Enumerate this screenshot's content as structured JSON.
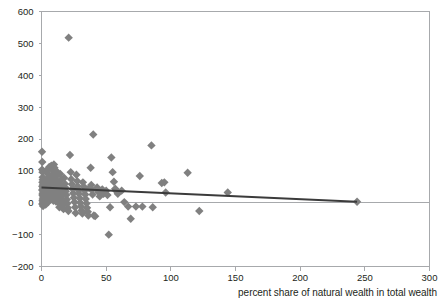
{
  "chart_data": {
    "type": "scatter",
    "title": "",
    "subtitle": "",
    "xlabel": "percent share of natural wealth in total wealth",
    "ylabel": "",
    "xlim": [
      0,
      300
    ],
    "ylim": [
      -200,
      600
    ],
    "xticks": [
      0,
      50,
      100,
      150,
      200,
      250,
      300
    ],
    "yticks": [
      -200,
      -100,
      0,
      100,
      200,
      300,
      400,
      500,
      600
    ],
    "xtick_labels": [
      "0",
      "50",
      "100",
      "150",
      "200",
      "250",
      "300"
    ],
    "ytick_labels": [
      "−200",
      "−100",
      "0",
      "100",
      "200",
      "300",
      "400",
      "500",
      "600"
    ],
    "grid": false,
    "legend": false,
    "legend_position": "none",
    "marker": {
      "shape": "diamond",
      "color": "#808080",
      "size": 4.2
    },
    "series": [
      {
        "name": "countries",
        "type": "scatter",
        "points": [
          [
            0.4,
            160
          ],
          [
            0.6,
            128
          ],
          [
            0.5,
            104
          ],
          [
            0.8,
            96
          ],
          [
            0.9,
            80
          ],
          [
            1.0,
            72
          ],
          [
            0.7,
            64
          ],
          [
            1.2,
            58
          ],
          [
            0.6,
            52
          ],
          [
            1.1,
            46
          ],
          [
            0.5,
            40
          ],
          [
            1.4,
            36
          ],
          [
            0.9,
            30
          ],
          [
            0.7,
            24
          ],
          [
            1.3,
            18
          ],
          [
            1.0,
            12
          ],
          [
            0.8,
            6
          ],
          [
            1.5,
            2
          ],
          [
            0.6,
            -4
          ],
          [
            1.2,
            -10
          ],
          [
            2.1,
            68
          ],
          [
            2.4,
            54
          ],
          [
            2.0,
            44
          ],
          [
            2.6,
            38
          ],
          [
            2.2,
            30
          ],
          [
            2.8,
            22
          ],
          [
            2.3,
            14
          ],
          [
            3.0,
            8
          ],
          [
            2.5,
            2
          ],
          [
            3.2,
            -6
          ],
          [
            3.6,
            96
          ],
          [
            4.0,
            74
          ],
          [
            3.8,
            58
          ],
          [
            4.4,
            50
          ],
          [
            4.1,
            42
          ],
          [
            4.7,
            34
          ],
          [
            4.3,
            26
          ],
          [
            5.0,
            18
          ],
          [
            4.6,
            10
          ],
          [
            5.2,
            2
          ],
          [
            5.5,
            108
          ],
          [
            6.0,
            112
          ],
          [
            5.8,
            88
          ],
          [
            6.4,
            66
          ],
          [
            6.1,
            54
          ],
          [
            6.8,
            46
          ],
          [
            6.3,
            38
          ],
          [
            7.0,
            30
          ],
          [
            6.6,
            20
          ],
          [
            7.2,
            10
          ],
          [
            7.6,
            116
          ],
          [
            8.0,
            104
          ],
          [
            7.8,
            84
          ],
          [
            8.4,
            70
          ],
          [
            8.1,
            58
          ],
          [
            8.8,
            48
          ],
          [
            8.3,
            40
          ],
          [
            9.0,
            30
          ],
          [
            8.6,
            18
          ],
          [
            9.2,
            6
          ],
          [
            9.6,
            120
          ],
          [
            10.0,
            110
          ],
          [
            9.8,
            92
          ],
          [
            10.4,
            76
          ],
          [
            10.1,
            62
          ],
          [
            10.8,
            50
          ],
          [
            10.3,
            42
          ],
          [
            11.0,
            32
          ],
          [
            10.6,
            22
          ],
          [
            11.2,
            4
          ],
          [
            11.8,
            98
          ],
          [
            12.2,
            86
          ],
          [
            12.0,
            66
          ],
          [
            12.6,
            54
          ],
          [
            12.3,
            44
          ],
          [
            13.0,
            34
          ],
          [
            12.7,
            24
          ],
          [
            13.4,
            12
          ],
          [
            13.1,
            0
          ],
          [
            13.8,
            -14
          ],
          [
            14.5,
            90
          ],
          [
            15.0,
            72
          ],
          [
            14.8,
            56
          ],
          [
            15.4,
            46
          ],
          [
            15.1,
            36
          ],
          [
            15.8,
            26
          ],
          [
            15.5,
            14
          ],
          [
            16.2,
            4
          ],
          [
            16.6,
            -8
          ],
          [
            17.0,
            -20
          ],
          [
            17.6,
            78
          ],
          [
            18.0,
            60
          ],
          [
            18.4,
            48
          ],
          [
            18.8,
            36
          ],
          [
            19.2,
            24
          ],
          [
            19.6,
            10
          ],
          [
            20.0,
            -2
          ],
          [
            20.4,
            -16
          ],
          [
            20.8,
            -26
          ],
          [
            21.0,
            518
          ],
          [
            22.0,
            150
          ],
          [
            22.6,
            96
          ],
          [
            23.0,
            74
          ],
          [
            23.5,
            58
          ],
          [
            24.0,
            44
          ],
          [
            24.5,
            30
          ],
          [
            25.0,
            16
          ],
          [
            25.5,
            2
          ],
          [
            26.0,
            -14
          ],
          [
            26.4,
            -32
          ],
          [
            27.0,
            88
          ],
          [
            27.6,
            68
          ],
          [
            28.0,
            52
          ],
          [
            28.6,
            40
          ],
          [
            29.0,
            28
          ],
          [
            29.6,
            14
          ],
          [
            30.0,
            0
          ],
          [
            30.5,
            -12
          ],
          [
            31.0,
            -24
          ],
          [
            31.6,
            -34
          ],
          [
            32.0,
            64
          ],
          [
            32.8,
            50
          ],
          [
            33.2,
            38
          ],
          [
            33.8,
            26
          ],
          [
            34.2,
            12
          ],
          [
            34.8,
            -2
          ],
          [
            35.2,
            -16
          ],
          [
            35.8,
            -28
          ],
          [
            36.2,
            -40
          ],
          [
            36.8,
            46
          ],
          [
            38.0,
            110
          ],
          [
            38.5,
            56
          ],
          [
            39.0,
            40
          ],
          [
            39.5,
            26
          ],
          [
            40.0,
            214
          ],
          [
            40.5,
            -40
          ],
          [
            41.5,
            -42
          ],
          [
            43.0,
            48
          ],
          [
            44.0,
            34
          ],
          [
            45.0,
            20
          ],
          [
            47.0,
            42
          ],
          [
            48.0,
            28
          ],
          [
            50.0,
            38
          ],
          [
            51.0,
            24
          ],
          [
            52.0,
            -100
          ],
          [
            53.0,
            -14
          ],
          [
            54.0,
            142
          ],
          [
            55.0,
            96
          ],
          [
            56.0,
            66
          ],
          [
            57.0,
            44
          ],
          [
            58.0,
            36
          ],
          [
            59.0,
            28
          ],
          [
            62.0,
            38
          ],
          [
            64.0,
            2
          ],
          [
            67.0,
            -12
          ],
          [
            69.0,
            -50
          ],
          [
            73.0,
            -12
          ],
          [
            76.0,
            84
          ],
          [
            78.0,
            -12
          ],
          [
            85.0,
            180
          ],
          [
            86.0,
            -14
          ],
          [
            93.0,
            62
          ],
          [
            95.0,
            64
          ],
          [
            96.0,
            32
          ],
          [
            113.0,
            94
          ],
          [
            122.0,
            -26
          ],
          [
            144.0,
            32
          ],
          [
            244.0,
            3
          ]
        ]
      }
    ],
    "trendline": {
      "name": "linear fit",
      "color": "#3b3b3b",
      "x_start": 0,
      "y_start": 48,
      "x_end": 244,
      "y_end": 3
    }
  }
}
